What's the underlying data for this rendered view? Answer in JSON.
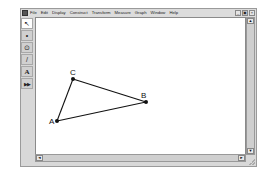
{
  "window": {
    "menu": [
      "File",
      "Edit",
      "Display",
      "Construct",
      "Transform",
      "Measure",
      "Graph",
      "Window",
      "Help"
    ],
    "controls": {
      "minimize": "_",
      "restore": "▣",
      "close": "×"
    }
  },
  "toolbox": [
    {
      "name": "selection-arrow-tool",
      "glyph": "↖",
      "selected": true
    },
    {
      "name": "point-tool",
      "glyph": "•",
      "selected": false
    },
    {
      "name": "compass-tool",
      "glyph": "⊙",
      "selected": false
    },
    {
      "name": "straightedge-tool",
      "glyph": "/",
      "selected": false
    },
    {
      "name": "text-tool",
      "glyph": "A",
      "selected": false
    },
    {
      "name": "custom-tool",
      "glyph": "▶▶",
      "selected": false
    }
  ],
  "sketch": {
    "points": {
      "A": {
        "label": "A",
        "x": 56,
        "y": 120
      },
      "B": {
        "label": "B",
        "x": 145,
        "y": 101
      },
      "C": {
        "label": "C",
        "x": 72,
        "y": 78
      }
    },
    "segments": [
      [
        "A",
        "C"
      ],
      [
        "C",
        "B"
      ],
      [
        "A",
        "B"
      ]
    ]
  },
  "scrollbars": {
    "up": "▲",
    "down": "▼",
    "left": "◄",
    "right": "►"
  }
}
